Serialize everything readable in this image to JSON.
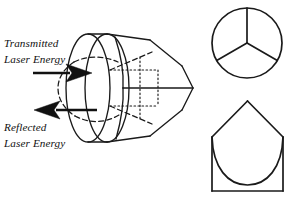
{
  "figure": {
    "background_color": "#ffffff",
    "ink_color": "#1a1a1a",
    "width": 292,
    "height": 197
  },
  "labels": {
    "transmitted_line1": "Transmitted",
    "transmitted_line2": "Laser Energy",
    "reflected_line1": "Reflected",
    "reflected_line2": "Laser Energy"
  },
  "annotations": {
    "transmitted_arrow_direction": "right",
    "reflected_arrow_direction": "left"
  },
  "views": {
    "main": {
      "name": "perspective-view",
      "description": "Lens disc joined to a trihedral corner cube prism"
    },
    "front": {
      "name": "front-view",
      "description": "Circular aperture with three radial intersection lines at 120 degrees"
    },
    "section": {
      "name": "section-view",
      "description": "Square base with peaked apex and inscribed arc"
    }
  }
}
